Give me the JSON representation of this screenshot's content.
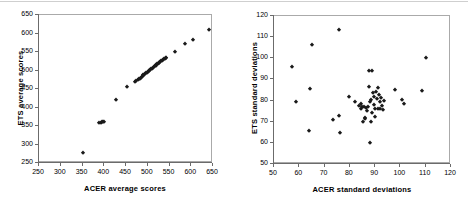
{
  "figure": {
    "panels": [
      {
        "id": "acer-ets-average-scores",
        "chart_data": {
          "type": "scatter",
          "title": "",
          "xlabel": "ACER average scores",
          "ylabel": "ETS average scores",
          "xlim": [
            250,
            650
          ],
          "ylim": [
            250,
            650
          ],
          "xticks": [
            250,
            300,
            350,
            400,
            450,
            500,
            550,
            600,
            650
          ],
          "yticks": [
            250,
            300,
            350,
            400,
            450,
            500,
            550,
            600,
            650
          ],
          "grid": false,
          "legend": "none",
          "marker": "diamond",
          "marker_color": "#1a1a1a",
          "points": [
            [
              352,
              277
            ],
            [
              389,
              359
            ],
            [
              392,
              357
            ],
            [
              395,
              360
            ],
            [
              398,
              361
            ],
            [
              400,
              362
            ],
            [
              428,
              420
            ],
            [
              452,
              455
            ],
            [
              471,
              468
            ],
            [
              474,
              471
            ],
            [
              477,
              473
            ],
            [
              479,
              476
            ],
            [
              482,
              478
            ],
            [
              484,
              481
            ],
            [
              486,
              483
            ],
            [
              488,
              485
            ],
            [
              490,
              487
            ],
            [
              492,
              489
            ],
            [
              494,
              491
            ],
            [
              496,
              492
            ],
            [
              498,
              494
            ],
            [
              500,
              496
            ],
            [
              502,
              498
            ],
            [
              504,
              500
            ],
            [
              506,
              501
            ],
            [
              508,
              503
            ],
            [
              510,
              505
            ],
            [
              512,
              507
            ],
            [
              514,
              509
            ],
            [
              516,
              511
            ],
            [
              518,
              513
            ],
            [
              520,
              515
            ],
            [
              521,
              517
            ],
            [
              523,
              518
            ],
            [
              525,
              520
            ],
            [
              527,
              521
            ],
            [
              529,
              523
            ],
            [
              531,
              525
            ],
            [
              533,
              527
            ],
            [
              535,
              529
            ],
            [
              537,
              530
            ],
            [
              539,
              532
            ],
            [
              541,
              533
            ],
            [
              543,
              535
            ],
            [
              563,
              551
            ],
            [
              586,
              571
            ],
            [
              604,
              583
            ],
            [
              641,
              609
            ]
          ]
        }
      },
      {
        "id": "acer-ets-standard-deviations",
        "chart_data": {
          "type": "scatter",
          "title": "",
          "xlabel": "ACER standard deviations",
          "ylabel": "ETS standard deviations",
          "xlim": [
            50,
            120
          ],
          "ylim": [
            50,
            120
          ],
          "xticks": [
            50,
            60,
            70,
            80,
            90,
            100,
            110,
            120
          ],
          "yticks": [
            50,
            60,
            70,
            80,
            90,
            100,
            110,
            120
          ],
          "grid": false,
          "legend": "none",
          "marker": "diamond",
          "marker_color": "#1a1a1a",
          "points": [
            [
              57.2,
              95.7
            ],
            [
              58.7,
              79.3
            ],
            [
              63.8,
              65.4
            ],
            [
              64.3,
              85.6
            ],
            [
              65.2,
              106.5
            ],
            [
              73.4,
              70.6
            ],
            [
              75.8,
              72.9
            ],
            [
              75.9,
              113.4
            ],
            [
              76.0,
              64.5
            ],
            [
              79.8,
              81.7
            ],
            [
              81.9,
              79.4
            ],
            [
              83.6,
              77.4
            ],
            [
              84.3,
              78.6
            ],
            [
              84.6,
              76.2
            ],
            [
              84.9,
              77.1
            ],
            [
              85.1,
              70.0
            ],
            [
              85.4,
              76.9
            ],
            [
              85.8,
              71.8
            ],
            [
              86.0,
              71.2
            ],
            [
              86.5,
              76.4
            ],
            [
              86.8,
              75.0
            ],
            [
              87.3,
              77.1
            ],
            [
              87.5,
              86.6
            ],
            [
              87.6,
              94.0
            ],
            [
              87.8,
              60.0
            ],
            [
              88.0,
              79.1
            ],
            [
              88.2,
              69.9
            ],
            [
              88.4,
              80.2
            ],
            [
              88.6,
              73.9
            ],
            [
              88.9,
              94.0
            ],
            [
              89.2,
              83.7
            ],
            [
              89.4,
              81.5
            ],
            [
              89.6,
              78.1
            ],
            [
              89.8,
              75.8
            ],
            [
              90.0,
              72.1
            ],
            [
              90.4,
              84.1
            ],
            [
              90.7,
              80.6
            ],
            [
              91.0,
              76.0
            ],
            [
              91.3,
              85.9
            ],
            [
              91.6,
              82.8
            ],
            [
              91.8,
              79.5
            ],
            [
              92.1,
              75.9
            ],
            [
              92.4,
              81.0
            ],
            [
              92.8,
              77.6
            ],
            [
              93.1,
              75.6
            ],
            [
              93.4,
              79.8
            ],
            [
              97.9,
              84.9
            ],
            [
              100.6,
              80.3
            ],
            [
              101.4,
              78.6
            ],
            [
              108.6,
              84.5
            ],
            [
              110.0,
              99.9
            ]
          ]
        }
      }
    ]
  }
}
